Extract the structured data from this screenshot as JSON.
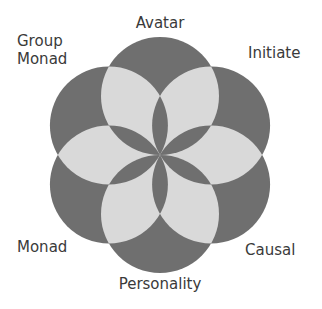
{
  "diagram": {
    "type": "six-circle rosette",
    "colors": {
      "circle_fill": "#6f6f6f",
      "overlap_fill": "#d9d9d9",
      "label": "#3a3a3a"
    },
    "labels": [
      {
        "id": "avatar",
        "text": "Avatar"
      },
      {
        "id": "initiate",
        "text": "Initiate"
      },
      {
        "id": "causal",
        "text": "Causal"
      },
      {
        "id": "personality",
        "text": "Personality"
      },
      {
        "id": "monad",
        "text": "Monad"
      },
      {
        "id": "group-monad",
        "lines": [
          "Group",
          "Monad"
        ]
      }
    ]
  }
}
